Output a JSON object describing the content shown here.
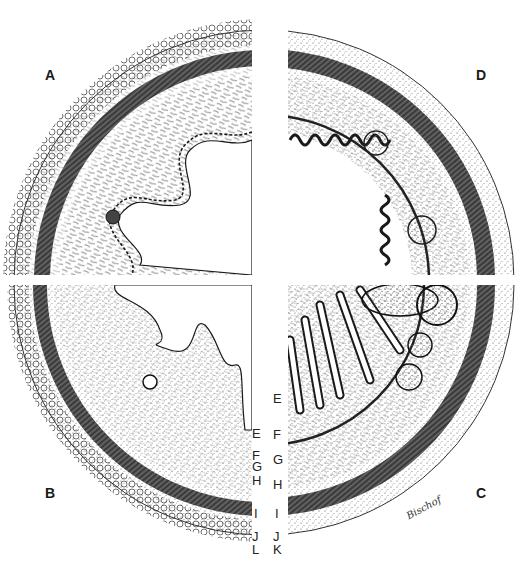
{
  "figure": {
    "quadrants": [
      {
        "id": "A",
        "position": "top-left",
        "label": "A"
      },
      {
        "id": "D",
        "position": "top-right",
        "label": "D"
      },
      {
        "id": "B",
        "position": "bottom-left",
        "label": "B"
      },
      {
        "id": "C",
        "position": "bottom-right",
        "label": "C"
      }
    ],
    "layer_labels_left": [
      "E",
      "F",
      "G",
      "H",
      "I",
      "J",
      "L"
    ],
    "layer_labels_right": [
      "E",
      "F",
      "G",
      "H",
      "I",
      "J",
      "K"
    ],
    "signature": "Bischof"
  },
  "colors": {
    "ink": "#1a1a1a",
    "stipple": "#555555",
    "paper": "#ffffff",
    "muscle_dark": "#2a2a2a"
  }
}
